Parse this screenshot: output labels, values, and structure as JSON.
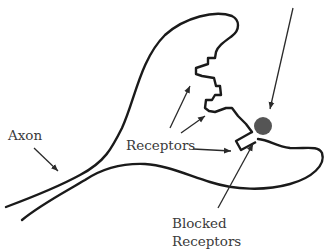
{
  "diagram": {
    "title": "",
    "labels": {
      "axon": "Axon",
      "receptors": "Receptors",
      "blocked_line1": "Blocked",
      "blocked_line2": "Receptors"
    },
    "colors": {
      "outline": "#1a1a1a",
      "arrow": "#2a2a2a",
      "blocker_molecule": "#555555",
      "label_text": "#3a3a3a",
      "background": "#ffffff"
    },
    "elements": [
      {
        "id": "neuron-terminal",
        "type": "outline"
      },
      {
        "id": "receptor-sites",
        "type": "jagged-edge"
      },
      {
        "id": "blocked-receptor",
        "type": "rectangle"
      },
      {
        "id": "blocker-molecule",
        "type": "circle"
      },
      {
        "id": "incoming-molecule-arrow",
        "type": "arrow"
      }
    ]
  }
}
